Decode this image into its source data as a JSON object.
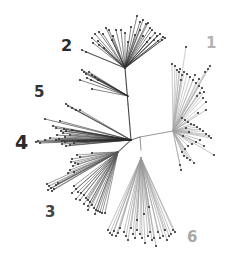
{
  "figure": {
    "type": "unrooted phylogenetic tree",
    "width": 228,
    "height": 262
  },
  "labels": [
    {
      "id": "1",
      "text": "1",
      "x": 206,
      "y": 36,
      "size": 15,
      "color": "#b4b4b4"
    },
    {
      "id": "2",
      "text": "2",
      "x": 61,
      "y": 38,
      "size": 16,
      "color": "#2a2a2a"
    },
    {
      "id": "5",
      "text": "5",
      "x": 34,
      "y": 85,
      "size": 15,
      "color": "#333333"
    },
    {
      "id": "4",
      "text": "4",
      "x": 15,
      "y": 133,
      "size": 19,
      "color": "#2a2a2a"
    },
    {
      "id": "3",
      "text": "3",
      "x": 45,
      "y": 205,
      "size": 15,
      "color": "#444444"
    },
    {
      "id": "6",
      "text": "6",
      "x": 187,
      "y": 230,
      "size": 15,
      "color": "#a8a8a8"
    }
  ],
  "root": {
    "x": 140,
    "y": 137
  },
  "backbone": [
    {
      "from": [
        140,
        137
      ],
      "to": [
        173,
        131
      ],
      "color": "#9a9a9a"
    },
    {
      "from": [
        140,
        137
      ],
      "to": [
        131,
        140
      ],
      "color": "#777777"
    },
    {
      "from": [
        140,
        137
      ],
      "to": [
        141,
        150
      ],
      "color": "#999999"
    },
    {
      "from": [
        131,
        140
      ],
      "to": [
        128,
        104
      ],
      "color": "#444444"
    },
    {
      "from": [
        128,
        104
      ],
      "to": [
        125,
        68
      ],
      "color": "#444444"
    },
    {
      "from": [
        131,
        140
      ],
      "to": [
        118,
        152
      ],
      "color": "#777777"
    }
  ],
  "clusters": [
    {
      "clade": "2",
      "color": "#333333",
      "hub": [
        125,
        68
      ],
      "leaves": [
        [
          137,
          16
        ],
        [
          140,
          22
        ],
        [
          143,
          20
        ],
        [
          146,
          24
        ],
        [
          148,
          23
        ],
        [
          150,
          28
        ],
        [
          152,
          30
        ],
        [
          155,
          33
        ],
        [
          157,
          36
        ],
        [
          160,
          34
        ],
        [
          163,
          37
        ],
        [
          165,
          38
        ],
        [
          162,
          40
        ],
        [
          158,
          41
        ],
        [
          154,
          40
        ],
        [
          150,
          38
        ],
        [
          147,
          42
        ],
        [
          143,
          36
        ],
        [
          140,
          30
        ],
        [
          135,
          35
        ],
        [
          131,
          27
        ],
        [
          128,
          42
        ],
        [
          125,
          33
        ],
        [
          121,
          30
        ],
        [
          116,
          30
        ],
        [
          113,
          36
        ],
        [
          112,
          40
        ],
        [
          109,
          30
        ],
        [
          106,
          28
        ],
        [
          103,
          34
        ],
        [
          99,
          32
        ],
        [
          95,
          34
        ],
        [
          92,
          38
        ],
        [
          93,
          43
        ],
        [
          99,
          45
        ],
        [
          104,
          48
        ],
        [
          98,
          41
        ],
        [
          82,
          50
        ],
        [
          86,
          52
        ]
      ]
    },
    {
      "clade": "2b",
      "color": "#333333",
      "hub": [
        128,
        96
      ],
      "leaves": [
        [
          82,
          70
        ],
        [
          84,
          72
        ],
        [
          86,
          74
        ],
        [
          89,
          72
        ],
        [
          92,
          75
        ],
        [
          95,
          77
        ],
        [
          87,
          78
        ],
        [
          98,
          80
        ],
        [
          80,
          80
        ],
        [
          91,
          80
        ],
        [
          92,
          89
        ]
      ]
    },
    {
      "clade": "5",
      "color": "#555555",
      "hub": [
        131,
        140
      ],
      "leaves": [
        [
          66,
          104
        ],
        [
          68,
          106
        ],
        [
          72,
          108
        ],
        [
          76,
          110
        ],
        [
          80,
          110
        ]
      ]
    },
    {
      "clade": "4",
      "color": "#2a2a2a",
      "hub": [
        131,
        140
      ],
      "leaves": [
        [
          45,
          119
        ],
        [
          53,
          126
        ],
        [
          56,
          128
        ],
        [
          60,
          121
        ],
        [
          61,
          131
        ],
        [
          63,
          133
        ],
        [
          64,
          129
        ],
        [
          66,
          131
        ],
        [
          57,
          135
        ],
        [
          59,
          139
        ],
        [
          62,
          141
        ],
        [
          65,
          142
        ],
        [
          56,
          140
        ],
        [
          50,
          138
        ],
        [
          45,
          140
        ],
        [
          38,
          141
        ],
        [
          36,
          142
        ],
        [
          40,
          143
        ],
        [
          62,
          144
        ],
        [
          66,
          146
        ],
        [
          70,
          145
        ],
        [
          74,
          143
        ],
        [
          78,
          141
        ],
        [
          70,
          135
        ],
        [
          72,
          130
        ],
        [
          65,
          137
        ]
      ]
    },
    {
      "clade": "3a",
      "color": "#666666",
      "hub": [
        118,
        152
      ],
      "leaves": [
        [
          77,
          155
        ],
        [
          80,
          157
        ],
        [
          72,
          159
        ],
        [
          71,
          162
        ],
        [
          75,
          163
        ],
        [
          78,
          164
        ],
        [
          73,
          166
        ],
        [
          70,
          170
        ],
        [
          74,
          172
        ],
        [
          68,
          173
        ],
        [
          92,
          153
        ]
      ]
    },
    {
      "clade": "3b",
      "color": "#555555",
      "hub": [
        118,
        152
      ],
      "leaves": [
        [
          47,
          184
        ],
        [
          49,
          186
        ],
        [
          51,
          188
        ],
        [
          52,
          191
        ],
        [
          54,
          189
        ],
        [
          48,
          190
        ],
        [
          56,
          185
        ],
        [
          58,
          183
        ]
      ]
    },
    {
      "clade": "3c",
      "color": "#555555",
      "hub": [
        118,
        152
      ],
      "leaves": [
        [
          74,
          186
        ],
        [
          76,
          189
        ],
        [
          78,
          192
        ],
        [
          81,
          193
        ],
        [
          84,
          195
        ],
        [
          86,
          198
        ],
        [
          88,
          200
        ],
        [
          90,
          202
        ],
        [
          92,
          205
        ],
        [
          94,
          208
        ],
        [
          96,
          210
        ],
        [
          98,
          211
        ],
        [
          100,
          212
        ],
        [
          102,
          213
        ],
        [
          105,
          213
        ],
        [
          84,
          204
        ],
        [
          88,
          206
        ],
        [
          76,
          199
        ],
        [
          80,
          200
        ],
        [
          72,
          193
        ],
        [
          88,
          210
        ],
        [
          95,
          214
        ]
      ]
    },
    {
      "clade": "6",
      "color": "#999999",
      "hub": [
        141,
        158
      ],
      "leaves": [
        [
          108,
          230
        ],
        [
          110,
          233
        ],
        [
          112,
          235
        ],
        [
          114,
          231
        ],
        [
          116,
          236
        ],
        [
          118,
          233
        ],
        [
          120,
          228
        ],
        [
          124,
          232
        ],
        [
          126,
          236
        ],
        [
          128,
          240
        ],
        [
          131,
          228
        ],
        [
          133,
          234
        ],
        [
          135,
          238
        ],
        [
          137,
          230
        ],
        [
          140,
          234
        ],
        [
          142,
          238
        ],
        [
          145,
          243
        ],
        [
          148,
          236
        ],
        [
          150,
          232
        ],
        [
          152,
          240
        ],
        [
          154,
          238
        ],
        [
          156,
          246
        ],
        [
          158,
          232
        ],
        [
          160,
          238
        ],
        [
          163,
          236
        ],
        [
          165,
          230
        ],
        [
          167,
          240
        ],
        [
          169,
          236
        ],
        [
          171,
          234
        ],
        [
          173,
          230
        ],
        [
          175,
          232
        ],
        [
          149,
          207
        ],
        [
          137,
          220
        ],
        [
          144,
          214
        ]
      ]
    },
    {
      "clade": "1a",
      "color": "#aaaaaa",
      "hub": [
        173,
        131
      ],
      "leaves": [
        [
          186,
          47
        ],
        [
          172,
          64
        ],
        [
          175,
          66
        ],
        [
          177,
          70
        ],
        [
          179,
          72
        ],
        [
          182,
          75
        ],
        [
          180,
          69
        ],
        [
          184,
          72
        ],
        [
          187,
          74
        ],
        [
          190,
          77
        ],
        [
          193,
          80
        ],
        [
          196,
          83
        ],
        [
          199,
          86
        ],
        [
          202,
          88
        ],
        [
          204,
          92
        ],
        [
          200,
          93
        ],
        [
          197,
          96
        ],
        [
          203,
          98
        ],
        [
          206,
          102
        ],
        [
          208,
          69
        ],
        [
          205,
          72
        ],
        [
          210,
          66
        ],
        [
          199,
          79
        ],
        [
          195,
          75
        ],
        [
          181,
          80
        ]
      ]
    },
    {
      "clade": "1b",
      "color": "#a0a0a0",
      "hub": [
        173,
        131
      ],
      "leaves": [
        [
          182,
          118
        ],
        [
          185,
          120
        ],
        [
          188,
          122
        ],
        [
          191,
          124
        ],
        [
          194,
          125
        ],
        [
          197,
          127
        ],
        [
          200,
          129
        ],
        [
          203,
          131
        ],
        [
          206,
          134
        ],
        [
          209,
          136
        ],
        [
          211,
          138
        ],
        [
          200,
          140
        ],
        [
          196,
          142
        ],
        [
          192,
          144
        ],
        [
          188,
          146
        ],
        [
          185,
          149
        ],
        [
          182,
          152
        ],
        [
          184,
          156
        ],
        [
          187,
          158
        ],
        [
          190,
          160
        ],
        [
          194,
          163
        ],
        [
          204,
          146
        ],
        [
          214,
          155
        ],
        [
          180,
          165
        ],
        [
          181,
          170
        ],
        [
          183,
          136
        ],
        [
          186,
          128
        ],
        [
          189,
          132
        ],
        [
          198,
          113
        ],
        [
          206,
          110
        ]
      ]
    }
  ],
  "leaf_dot": {
    "radius": 1.1,
    "color": "#333333"
  }
}
